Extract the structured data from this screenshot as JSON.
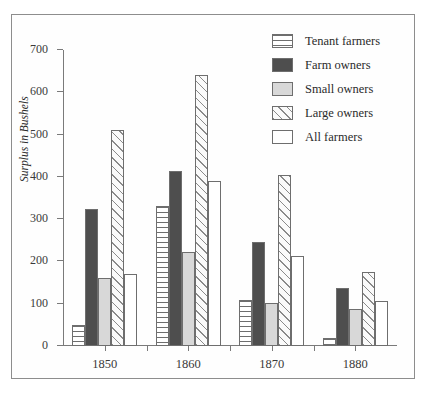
{
  "chart_data": {
    "type": "bar",
    "title": "",
    "xlabel": "",
    "ylabel": "Surplus in Bushels",
    "ylim": [
      0,
      700
    ],
    "yticks": [
      0,
      100,
      200,
      300,
      400,
      500,
      600,
      700
    ],
    "ytick_labels": [
      "0",
      "100",
      "200",
      "300",
      "400",
      "500",
      "600",
      "700"
    ],
    "categories": [
      "1850",
      "1860",
      "1870",
      "1880"
    ],
    "grid": false,
    "legend_position": "top-right",
    "series": [
      {
        "name": "Tenant farmers",
        "pattern": "horizontal-lines",
        "values": [
          50,
          330,
          108,
          20
        ]
      },
      {
        "name": "Farm owners",
        "pattern": "solid-dark",
        "values": [
          325,
          415,
          245,
          138
        ]
      },
      {
        "name": "Small owners",
        "pattern": "light-gray",
        "values": [
          160,
          222,
          102,
          88
        ]
      },
      {
        "name": "Large owners",
        "pattern": "diagonal-hatch",
        "values": [
          512,
          640,
          405,
          175
        ]
      },
      {
        "name": "All farmers",
        "pattern": "white",
        "values": [
          170,
          390,
          212,
          107
        ]
      }
    ]
  },
  "legend": {
    "items": [
      {
        "label": "Tenant farmers"
      },
      {
        "label": "Farm owners"
      },
      {
        "label": "Small owners"
      },
      {
        "label": "Large owners"
      },
      {
        "label": "All farmers"
      }
    ]
  }
}
